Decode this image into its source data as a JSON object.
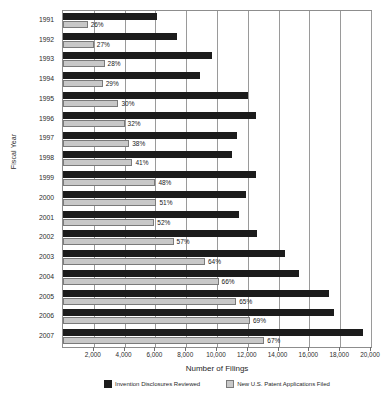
{
  "chart_data": {
    "type": "bar",
    "orientation": "horizontal",
    "title": "",
    "xlabel": "Number of Filings",
    "ylabel": "Fiscal Year",
    "xlim": [
      0,
      20000
    ],
    "xticks": [
      "2,000",
      "4,000",
      "6,000",
      "8,000",
      "10,000",
      "12,000",
      "14,000",
      "16,000",
      "18,000",
      "20,000"
    ],
    "xtick_values": [
      2000,
      4000,
      6000,
      8000,
      10000,
      12000,
      14000,
      16000,
      18000,
      20000
    ],
    "grid": true,
    "legend_position": "bottom",
    "categories": [
      "1991",
      "1992",
      "1993",
      "1994",
      "1995",
      "1996",
      "1997",
      "1998",
      "1999",
      "2000",
      "2001",
      "2002",
      "2003",
      "2004",
      "2005",
      "2006",
      "2007"
    ],
    "series": [
      {
        "name": "Invention Disclosures Reviewed",
        "color": "#1c1c1c",
        "values": [
          6100,
          7400,
          9700,
          8900,
          12000,
          12500,
          11300,
          11000,
          12500,
          11900,
          11400,
          12600,
          14400,
          15300,
          17300,
          17600,
          19500
        ]
      },
      {
        "name": "New U.S. Patent Applications Filed",
        "color": "#c8c8c8",
        "values": [
          1600,
          2000,
          2700,
          2580,
          3600,
          4000,
          4300,
          4510,
          6000,
          6070,
          5930,
          7180,
          9220,
          10100,
          11250,
          12140,
          13070
        ]
      }
    ],
    "data_labels": {
      "series": "New U.S. Patent Applications Filed",
      "values": [
        "26%",
        "27%",
        "28%",
        "29%",
        "30%",
        "32%",
        "38%",
        "41%",
        "48%",
        "51%",
        "52%",
        "57%",
        "64%",
        "66%",
        "65%",
        "69%",
        "67%"
      ]
    }
  },
  "legend": {
    "items": [
      {
        "label": "Invention Disclosures Reviewed",
        "swatch": "dark-swatch"
      },
      {
        "label": "New U.S. Patent Applications Filed",
        "swatch": "light-swatch"
      }
    ]
  }
}
